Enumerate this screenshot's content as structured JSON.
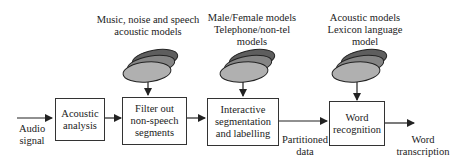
{
  "diagram": {
    "input": {
      "label_line1": "Audio",
      "label_line2": "signal"
    },
    "blocks": [
      {
        "id": "acoustic-analysis",
        "line1": "Acoustic",
        "line2": "analysis",
        "line3": ""
      },
      {
        "id": "filter",
        "line1": "Filter out",
        "line2": "non-speech",
        "line3": "segments"
      },
      {
        "id": "segmentation",
        "line1": "Interactive",
        "line2": "segmentation",
        "line3": "and labelling"
      },
      {
        "id": "word-recognition",
        "line1": "Word",
        "line2": "recognition",
        "line3": ""
      }
    ],
    "models": [
      {
        "line1": "Music, noise and speech",
        "line2": "acoustic models",
        "line3": ""
      },
      {
        "line1": "Male/Female models",
        "line2": "Telephone/non-tel",
        "line3": "models"
      },
      {
        "line1": "Acoustic models",
        "line2": "Lexicon language",
        "line3": "model"
      }
    ],
    "edge_labels": {
      "partitioned_line1": "Partitioned",
      "partitioned_line2": "data",
      "output_line1": "Word",
      "output_line2": "transcription"
    },
    "colors": {
      "disk_top": "#5e5e5e",
      "disk_mid": "#858585",
      "disk_front": "#b0b0b0",
      "stroke": "#222222"
    }
  }
}
